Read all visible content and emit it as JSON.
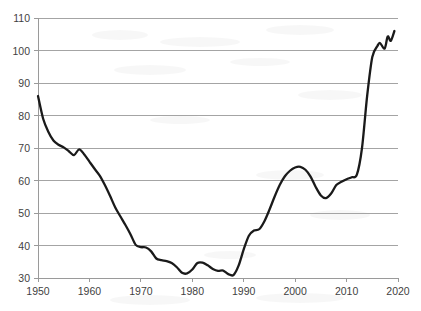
{
  "chart_data": {
    "type": "line",
    "title": "",
    "subtitle": "",
    "xlabel": "",
    "ylabel": "",
    "xlim": [
      1950,
      2020
    ],
    "ylim": [
      30,
      110
    ],
    "grid": true,
    "legend": false,
    "legend_position": "none",
    "series_color": "#1a1a1a",
    "grid_color": "#9a9a9a",
    "x_ticks": [
      1950,
      1960,
      1970,
      1980,
      1990,
      2000,
      2010,
      2020
    ],
    "x_tick_labels": [
      "1950",
      "1960",
      "1970",
      "1980",
      "1990",
      "2000",
      "2010",
      "2020"
    ],
    "y_ticks": [
      30,
      40,
      50,
      60,
      70,
      80,
      90,
      100,
      110
    ],
    "y_tick_labels": [
      "30",
      "40",
      "50",
      "60",
      "70",
      "80",
      "90",
      "100",
      "110"
    ],
    "series": [
      {
        "name": "series-1",
        "x": [
          1950,
          1951,
          1952,
          1953,
          1954,
          1955,
          1956,
          1957,
          1958,
          1959,
          1960,
          1961,
          1962,
          1963,
          1964,
          1965,
          1966,
          1967,
          1968,
          1969,
          1970,
          1971,
          1972,
          1973,
          1974,
          1975,
          1976,
          1977,
          1978,
          1979,
          1980,
          1981,
          1982,
          1983,
          1984,
          1985,
          1986,
          1987,
          1988,
          1989,
          1990,
          1991,
          1992,
          1993,
          1994,
          1995,
          1996,
          1997,
          1998,
          1999,
          2000,
          2001,
          2002,
          2003,
          2004,
          2005,
          2006,
          2007,
          2008,
          2009,
          2010,
          2011,
          2012,
          2013,
          2014,
          2015,
          2016,
          2017,
          2018,
          2019
        ],
        "values": [
          86.0,
          79.0,
          75.0,
          72.3,
          71.0,
          70.2,
          69.0,
          67.8,
          69.6,
          68.0,
          65.8,
          63.6,
          61.5,
          58.6,
          55.3,
          51.8,
          49.0,
          46.3,
          43.4,
          40.2,
          39.5,
          39.4,
          38.2,
          36.0,
          35.5,
          35.2,
          34.6,
          33.3,
          31.6,
          31.4,
          32.6,
          34.6,
          34.7,
          33.9,
          32.8,
          32.2,
          32.3,
          31.2,
          30.9,
          33.8,
          38.8,
          43.0,
          44.6,
          45.0,
          47.4,
          51.0,
          55.0,
          58.6,
          61.3,
          63.0,
          64.0,
          64.2,
          63.3,
          61.2,
          58.0,
          55.4,
          54.6,
          56.0,
          58.6,
          59.6,
          60.4,
          61.0,
          61.8,
          70.0,
          86.0,
          98.0,
          101.4,
          102.3,
          100.6,
          104.2
        ]
      }
    ],
    "series_extra_points": {
      "note": "tail wiggle after 2019",
      "x": [
        2016.5,
        2017.4,
        2018.0,
        2018.6,
        2019.3
      ],
      "values": [
        102.3,
        100.6,
        104.3,
        103.0,
        106.0
      ]
    }
  }
}
